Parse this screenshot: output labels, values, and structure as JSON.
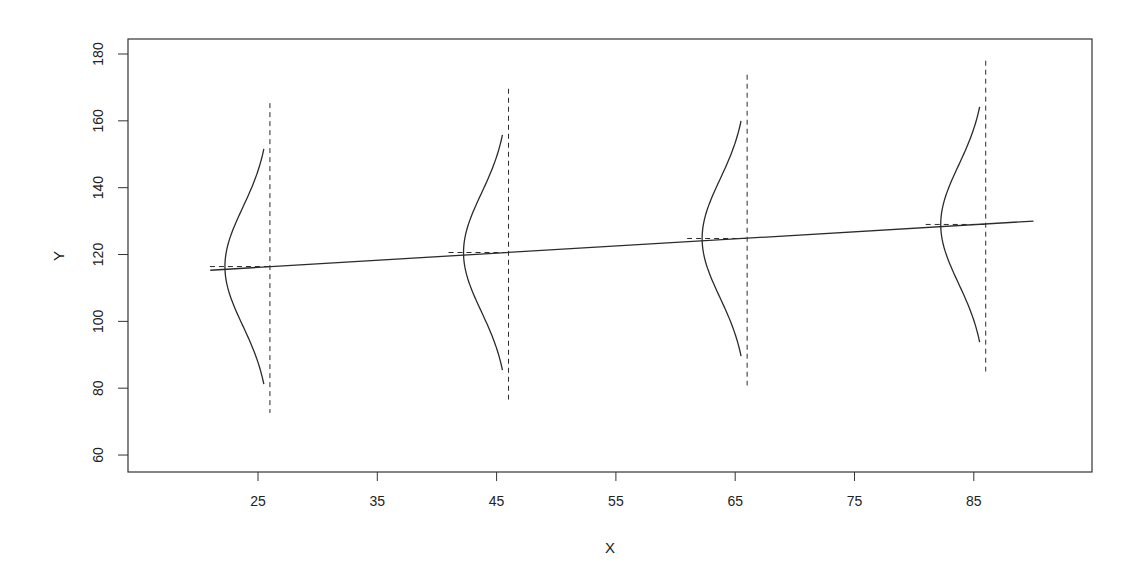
{
  "chart_data": {
    "type": "line",
    "title": "",
    "xlabel": "X",
    "ylabel": "Y",
    "xlim": [
      14.2,
      95.0
    ],
    "ylim": [
      55.0,
      185.0
    ],
    "x_ticks": [
      25,
      35,
      45,
      55,
      65,
      75,
      85
    ],
    "y_ticks": [
      60,
      80,
      100,
      120,
      140,
      160,
      180
    ],
    "grid": false,
    "legend": null,
    "regression_line": {
      "style": "solid",
      "x": [
        21,
        90
      ],
      "y": [
        115.3,
        130.0
      ],
      "intercept": 110.9,
      "slope": 0.21
    },
    "conditional_distributions": [
      {
        "x": 26,
        "mean": 116.4,
        "sd": 17.6,
        "curve_range": [
          81.2,
          151.6
        ],
        "dashed_range": [
          72.6,
          165.3
        ]
      },
      {
        "x": 46,
        "mean": 120.6,
        "sd": 17.6,
        "curve_range": [
          85.4,
          155.8
        ],
        "dashed_range": [
          76.6,
          169.6
        ]
      },
      {
        "x": 66,
        "mean": 124.8,
        "sd": 17.6,
        "curve_range": [
          89.6,
          160.0
        ],
        "dashed_range": [
          80.8,
          173.8
        ]
      },
      {
        "x": 86,
        "mean": 129.0,
        "sd": 17.6,
        "curve_range": [
          93.8,
          164.2
        ],
        "dashed_range": [
          85.0,
          178.0
        ]
      }
    ],
    "annotations": "Normal density curves drawn sideways at each X, with dashed vertical reference lines and short dashed horizontal segments at the conditional mean"
  },
  "colors": {
    "line": "#2b2b2b",
    "axis": "#333333",
    "background": "#ffffff"
  }
}
